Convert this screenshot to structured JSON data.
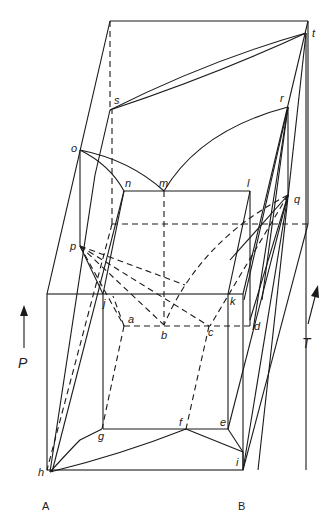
{
  "diagram": {
    "type": "ternary-like 3D phase prism (P–T–composition)",
    "components": {
      "left": "A",
      "right": "B"
    },
    "axes": {
      "pressure": "P",
      "temperature": "T"
    },
    "points": {
      "a": "a",
      "b": "b",
      "c": "c",
      "d": "d",
      "e": "e",
      "f": "f",
      "g": "g",
      "h": "h",
      "i": "i",
      "j": "j",
      "k": "k",
      "l": "l",
      "m": "m",
      "n": "n",
      "o": "o",
      "p": "p",
      "q": "q",
      "r": "r",
      "s": "s",
      "t": "t"
    },
    "color": "#1a1a1a"
  }
}
